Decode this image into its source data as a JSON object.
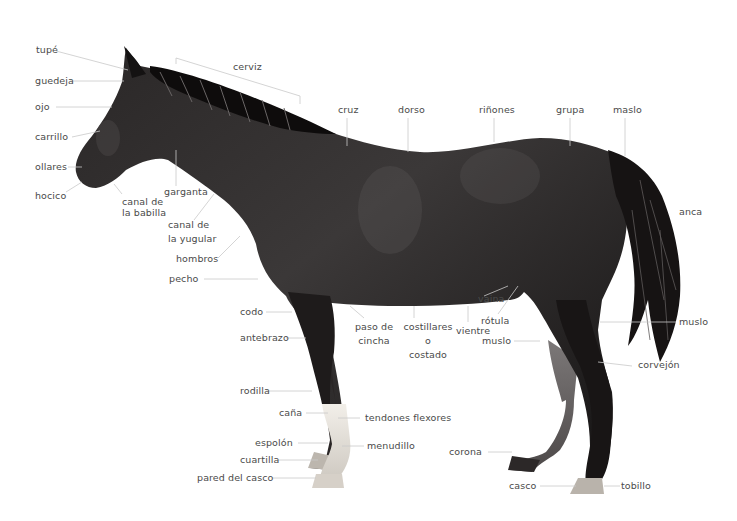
{
  "diagram": {
    "image_colors": {
      "background": "#ffffff",
      "horse_body": "#1c1a1a",
      "label_text": "#4a4a4a",
      "leader_line": "#c8c8c8",
      "white_sock": "#e6e2dc"
    },
    "labels": {
      "tupe": "tupé",
      "guedeja": "guedeja",
      "ojo": "ojo",
      "carrillo": "carrillo",
      "ollares": "ollares",
      "hocico": "hocico",
      "canal_babilla_1": "canal de",
      "canal_babilla_2": "la babilla",
      "garganta": "garganta",
      "canal_yugular_1": "canal de",
      "canal_yugular_2": "la yugular",
      "hombros": "hombros",
      "pecho": "pecho",
      "cerviz": "cerviz",
      "cruz": "cruz",
      "dorso": "dorso",
      "rinones": "riñones",
      "grupa": "grupa",
      "maslo": "maslo",
      "anca": "anca",
      "muslo_tail": "muslo",
      "corvejon": "corvejón",
      "codo": "codo",
      "antebrazo": "antebrazo",
      "paso_cincha_1": "paso de",
      "paso_cincha_2": "cincha",
      "costillares_1": "costillares",
      "costillares_2": "o",
      "costillares_3": "costado",
      "vientre": "vientre",
      "vaina": "vaina",
      "rotula": "rótula",
      "muslo_front": "muslo",
      "rodilla": "rodilla",
      "cana": "caña",
      "tendones_flexores": "tendones flexores",
      "espolon": "espolón",
      "menudillo": "menudillo",
      "cuartilla": "cuartilla",
      "pared_casco": "pared del casco",
      "corona": "corona",
      "casco": "casco",
      "tobillo": "tobillo"
    }
  }
}
